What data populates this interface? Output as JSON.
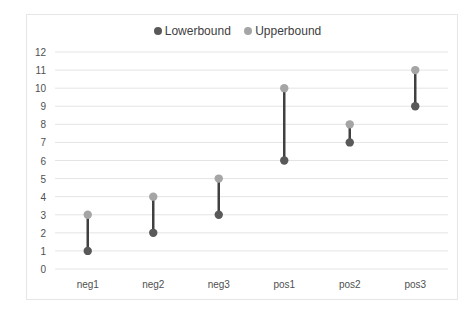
{
  "chart_data": {
    "type": "line",
    "subtype": "high-low range (dumbbell)",
    "title": "",
    "xlabel": "",
    "ylabel": "",
    "categories": [
      "neg1",
      "neg2",
      "neg3",
      "pos1",
      "pos2",
      "pos3"
    ],
    "series": [
      {
        "name": "Lowerbound",
        "color": "#595959",
        "values": [
          1,
          2,
          3,
          6,
          7,
          9
        ]
      },
      {
        "name": "Upperbound",
        "color": "#a5a5a5",
        "values": [
          3,
          4,
          5,
          10,
          8,
          11
        ]
      }
    ],
    "yticks": [
      "0",
      "1",
      "2",
      "3",
      "4",
      "5",
      "6",
      "7",
      "8",
      "9",
      "10",
      "11",
      "12"
    ],
    "ylim": [
      0,
      12
    ],
    "grid": true,
    "legend_position": "top",
    "connector_color": "#404040"
  },
  "legend": {
    "items": [
      {
        "label": "Lowerbound",
        "color": "#595959"
      },
      {
        "label": "Upperbound",
        "color": "#a5a5a5"
      }
    ]
  }
}
